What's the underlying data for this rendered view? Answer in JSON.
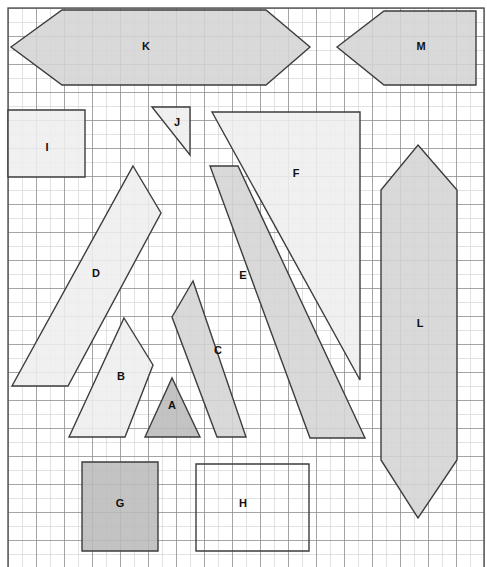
{
  "canvas": {
    "width": 487,
    "height": 567,
    "background": "#ffffff"
  },
  "grid": {
    "origin_x": 8,
    "origin_y": 8,
    "cell_size": 28,
    "cols": 17,
    "rows": 20,
    "line_color": "#8f8f8f",
    "line_width": 0.8,
    "minor_line_color": "#cfcfcf",
    "minor_subdivisions": 2,
    "border_color": "#555555",
    "border_width": 1.4
  },
  "style": {
    "fill_light": "#eeeeee",
    "fill_medium": "#d4d4d4",
    "fill_dark": "#bbbbbb",
    "fill_none": "#ffffff",
    "stroke": "#3d3d3d",
    "stroke_width": 1.4,
    "opacity": 0.88
  },
  "chart_data": {
    "type": "diagram",
    "title": "",
    "shape_count": 13,
    "labels": [
      "A",
      "B",
      "C",
      "D",
      "E",
      "F",
      "G",
      "H",
      "I",
      "J",
      "K",
      "L",
      "M"
    ],
    "shapes": [
      {
        "id": "A",
        "label": "A",
        "kind": "triangle",
        "shade": "dark",
        "points": "145,437 172,378 200,437",
        "label_x": 172,
        "label_y": 406
      },
      {
        "id": "B",
        "label": "B",
        "kind": "quadrilateral",
        "shade": "light",
        "points": "124,318 153,365 125,437 69,437",
        "label_x": 121,
        "label_y": 377
      },
      {
        "id": "C",
        "label": "C",
        "kind": "quadrilateral",
        "shade": "medium",
        "points": "193,281 172,317 217,437 246,437",
        "label_x": 218,
        "label_y": 351
      },
      {
        "id": "D",
        "label": "D",
        "kind": "quadrilateral",
        "shade": "light",
        "points": "133,166 161,213 68,386 12,386",
        "label_x": 96,
        "label_y": 274
      },
      {
        "id": "E",
        "label": "E",
        "kind": "quadrilateral",
        "shade": "medium",
        "points": "210,166 238,166 365,438 310,438",
        "label_x": 243,
        "label_y": 276
      },
      {
        "id": "F",
        "label": "F",
        "kind": "triangle",
        "shade": "light",
        "points": "212,112 360,112 360,380",
        "label_x": 296,
        "label_y": 174
      },
      {
        "id": "G",
        "label": "G",
        "kind": "rectangle",
        "shade": "dark",
        "points": "82,462 158,462 158,551 82,551",
        "label_x": 120,
        "label_y": 504
      },
      {
        "id": "H",
        "label": "H",
        "kind": "rectangle",
        "shade": "none",
        "points": "196,464 309,464 309,551 196,551",
        "label_x": 243,
        "label_y": 504
      },
      {
        "id": "I",
        "label": "I",
        "kind": "rectangle",
        "shade": "light",
        "points": "8,110 85,110 85,177 8,177",
        "label_x": 47,
        "label_y": 148
      },
      {
        "id": "J",
        "label": "J",
        "kind": "triangle",
        "shade": "light",
        "points": "152,107 190,107 190,155",
        "label_x": 177,
        "label_y": 123
      },
      {
        "id": "K",
        "label": "K",
        "kind": "hexagon",
        "shade": "medium",
        "points": "11,47 62,10 266,10 310,47 266,85 62,85",
        "label_x": 146,
        "label_y": 47
      },
      {
        "id": "L",
        "label": "L",
        "kind": "hexagon",
        "shade": "medium",
        "points": "418,145 457,190 457,460 418,518 381,460 381,190",
        "label_x": 420,
        "label_y": 324
      },
      {
        "id": "M",
        "label": "M",
        "kind": "pentagon",
        "shade": "medium",
        "points": "337,47 384,11 476,11 476,85 384,85",
        "label_x": 421,
        "label_y": 47
      }
    ]
  }
}
